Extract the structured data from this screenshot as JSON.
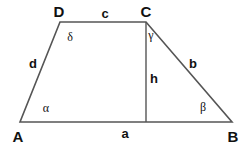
{
  "figure": {
    "shape": "trapezoid",
    "stroke_color": "#555555",
    "text_color": "#111111",
    "background_color": "#ffffff",
    "width": 247,
    "height": 149
  },
  "vertices": [
    {
      "name": "A",
      "label": "A",
      "x": 20,
      "y": 122,
      "label_x": 18,
      "label_y": 136
    },
    {
      "name": "B",
      "label": "B",
      "x": 232,
      "y": 122,
      "label_x": 233,
      "label_y": 136
    },
    {
      "name": "C",
      "label": "C",
      "x": 146,
      "y": 22,
      "label_x": 146,
      "label_y": 11
    },
    {
      "name": "D",
      "label": "D",
      "x": 60,
      "y": 22,
      "label_x": 59,
      "label_y": 11
    }
  ],
  "edges": [
    {
      "name": "AB",
      "label": "a",
      "from": "A",
      "to": "B",
      "label_x": 125,
      "label_y": 133
    },
    {
      "name": "BC",
      "label": "b",
      "from": "B",
      "to": "C",
      "label_x": 193,
      "label_y": 63
    },
    {
      "name": "CD",
      "label": "c",
      "from": "C",
      "to": "D",
      "label_x": 105,
      "label_y": 13
    },
    {
      "name": "DA",
      "label": "d",
      "from": "D",
      "to": "A",
      "label_x": 33,
      "label_y": 63
    }
  ],
  "height": {
    "name": "h",
    "label": "h",
    "from_x": 146,
    "from_y": 22,
    "to_x": 146,
    "to_y": 122,
    "label_x": 154,
    "label_y": 78
  },
  "angles": [
    {
      "name": "alpha",
      "label": "α",
      "at_vertex": "A",
      "label_x": 46,
      "label_y": 108
    },
    {
      "name": "beta",
      "label": "β",
      "at_vertex": "B",
      "label_x": 203,
      "label_y": 107
    },
    {
      "name": "gamma",
      "label": "γ",
      "at_vertex": "C",
      "label_x": 151,
      "label_y": 35
    },
    {
      "name": "delta",
      "label": "δ",
      "at_vertex": "D",
      "label_x": 70,
      "label_y": 37
    }
  ]
}
